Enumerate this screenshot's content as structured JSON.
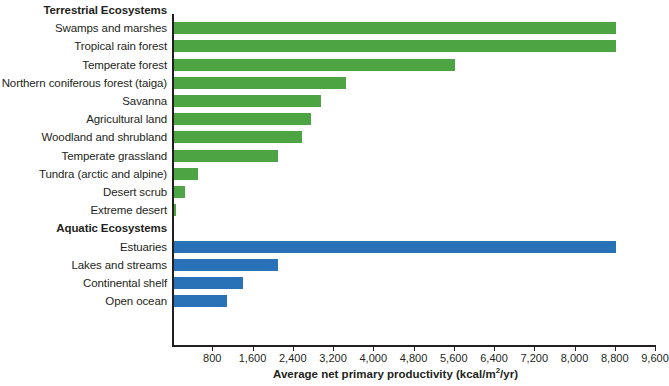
{
  "chart_data": {
    "type": "bar",
    "orientation": "horizontal",
    "title": "",
    "xlabel": "Average net primary productivity (kcal/m2/yr)",
    "xlabel_display": "Average net primary productivity (kcal/m",
    "xlabel_sup": "2",
    "xlabel_tail": "/yr)",
    "ylabel": "",
    "xlim": [
      0,
      9600
    ],
    "grid": false,
    "legend_position": "none",
    "tick_step": 800,
    "tick_labels": [
      "800",
      "1,600",
      "2,400",
      "3,200",
      "4,000",
      "4,800",
      "5,600",
      "6,400",
      "7,200",
      "8,000",
      "8,800",
      "9,600"
    ],
    "tick_values": [
      800,
      1600,
      2400,
      3200,
      4000,
      4800,
      5600,
      6400,
      7200,
      8000,
      8800,
      9600
    ],
    "colors": {
      "terrestrial": "#4ca442",
      "aquatic": "#2a72b8",
      "axis": "#231f20",
      "text": "#231f20",
      "background": "#ffffff"
    },
    "sections": [
      {
        "name": "Terrestrial Ecosystems",
        "group": "terrestrial",
        "categories": [
          "Swamps and marshes",
          "Tropical rain forest",
          "Temperate forest",
          "Northern coniferous forest (taiga)",
          "Savanna",
          "Agricultural land",
          "Woodland and shrubland",
          "Temperate grassland",
          "Tundra (arctic and alpine)",
          "Desert scrub",
          "Extreme desert"
        ],
        "values": [
          8800,
          8800,
          5600,
          3440,
          2940,
          2750,
          2570,
          2090,
          500,
          240,
          60
        ]
      },
      {
        "name": "Aquatic Ecosystems",
        "group": "aquatic",
        "categories": [
          "Estuaries",
          "Lakes and streams",
          "Continental shelf",
          "Open ocean"
        ],
        "values": [
          8800,
          2090,
          1390,
          1070
        ]
      }
    ],
    "categories": [
      "Swamps and marshes",
      "Tropical rain forest",
      "Temperate forest",
      "Northern coniferous forest (taiga)",
      "Savanna",
      "Agricultural land",
      "Woodland and shrubland",
      "Temperate grassland",
      "Tundra (arctic and alpine)",
      "Desert scrub",
      "Extreme desert",
      "Estuaries",
      "Lakes and streams",
      "Continental shelf",
      "Open ocean"
    ],
    "values": [
      8800,
      8800,
      5600,
      3440,
      2940,
      2750,
      2570,
      2090,
      500,
      240,
      60,
      8800,
      2090,
      1390,
      1070
    ]
  }
}
